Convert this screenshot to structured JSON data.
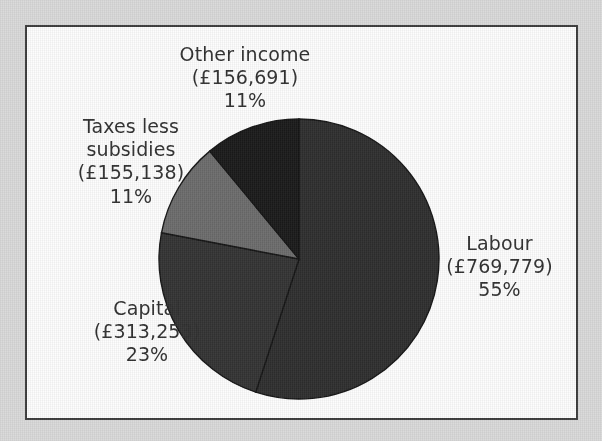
{
  "figure": {
    "background_color": "#d9d9d9",
    "panel_color": "#fdfdfd",
    "border_color": "#3c3c3c"
  },
  "chart_data": {
    "type": "pie",
    "title": "",
    "subtitle": "",
    "xlabel": "",
    "ylabel": "",
    "legend_position": "none",
    "grid": false,
    "currency_symbol": "£",
    "start_angle_deg": 0,
    "direction": "clockwise",
    "categories": [
      "Labour",
      "Capital",
      "Taxes less subsidies",
      "Other income"
    ],
    "values": [
      769779,
      313253,
      155138,
      156691
    ],
    "percentages": [
      55,
      23,
      11,
      11
    ],
    "colors": [
      "#2e2e2e",
      "#333333",
      "#6b6b6b",
      "#1a1a1a"
    ],
    "labels": [
      {
        "name": "Labour",
        "value_text": "(£769,779)",
        "percent_text": "55%",
        "value": 769779,
        "percent": 55,
        "color": "#2e2e2e"
      },
      {
        "name": "Capital",
        "value_text": "(£313,253)",
        "percent_text": "23%",
        "value": 313253,
        "percent": 23,
        "color": "#333333"
      },
      {
        "name": "Taxes less",
        "name_line2": "subsidies",
        "value_text": "(£155,138)",
        "percent_text": "11%",
        "value": 155138,
        "percent": 11,
        "color": "#6b6b6b"
      },
      {
        "name": "Other income",
        "value_text": "(£156,691)",
        "percent_text": "11%",
        "value": 156691,
        "percent": 11,
        "color": "#1a1a1a"
      }
    ]
  }
}
